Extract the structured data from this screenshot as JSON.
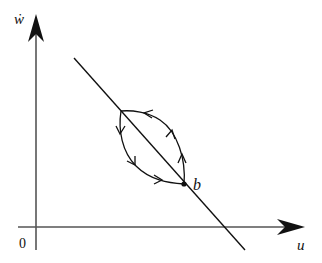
{
  "diagram": {
    "type": "phase-portrait",
    "axes": {
      "x_label": "u",
      "y_label": "ẇ",
      "origin_label": "0"
    },
    "line": {
      "description": "straight line with negative slope crossing the u-axis"
    },
    "points": [
      {
        "id": "upper",
        "label": ""
      },
      {
        "id": "b",
        "label": "b"
      }
    ],
    "orbits": [
      {
        "name": "upper-right-orbit",
        "from": "b",
        "to": "upper",
        "arrow_count": 3,
        "direction": "counterclockwise-up"
      },
      {
        "name": "lower-left-orbit",
        "from": "upper",
        "to": "b",
        "arrow_count": 3,
        "direction": "down-right"
      }
    ],
    "colors": {
      "ink": "#111111",
      "axis": "#555555",
      "background": "#ffffff"
    }
  }
}
